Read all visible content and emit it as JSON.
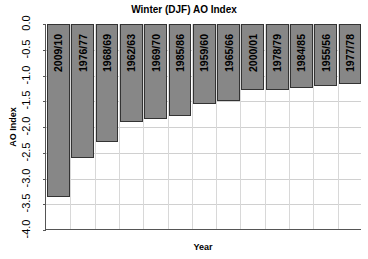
{
  "chart_data": {
    "type": "bar",
    "title": "Winter (DJF) AO Index",
    "xlabel": "Year",
    "ylabel": "AO Index",
    "ylim": [
      -4.0,
      0.0
    ],
    "yticks": [
      "0.0",
      "-0.5",
      "-1.0",
      "-1.5",
      "-2.0",
      "-2.5",
      "-3.0",
      "-3.5",
      "-4.0"
    ],
    "grid": true,
    "legend": null,
    "categories": [
      "2009/10",
      "1976/77",
      "1968/69",
      "1962/63",
      "1969/70",
      "1985/86",
      "1959/60",
      "1965/66",
      "2000/01",
      "1978/79",
      "1984/85",
      "1955/56",
      "1977/78"
    ],
    "values": [
      -3.36,
      -2.61,
      -2.29,
      -1.91,
      -1.85,
      -1.79,
      -1.55,
      -1.49,
      -1.29,
      -1.29,
      -1.24,
      -1.2,
      -1.17
    ],
    "bar_color": "#878787",
    "bar_labels_position": "inside-top-rotated"
  }
}
